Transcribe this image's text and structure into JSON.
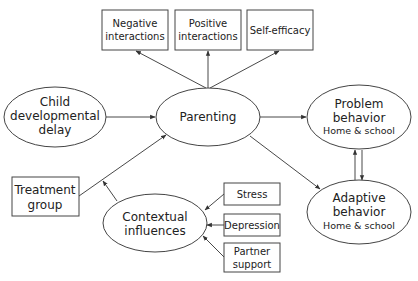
{
  "diagram": {
    "nodes": [
      {
        "id": "neg",
        "shape": "box",
        "lines": [
          "Negative",
          "interactions"
        ]
      },
      {
        "id": "pos",
        "shape": "box",
        "lines": [
          "Positive",
          "interactions"
        ]
      },
      {
        "id": "self",
        "shape": "box",
        "lines": [
          "Self-efficacy"
        ]
      },
      {
        "id": "child",
        "shape": "ellipse",
        "lines": [
          "Child",
          "developmental",
          "delay"
        ]
      },
      {
        "id": "parenting",
        "shape": "ellipse",
        "lines": [
          "Parenting"
        ]
      },
      {
        "id": "problem",
        "shape": "ellipse",
        "lines": [
          "Problem",
          "behavior"
        ],
        "sub": "Home & school"
      },
      {
        "id": "adaptive",
        "shape": "ellipse",
        "lines": [
          "Adaptive",
          "behavior"
        ],
        "sub": "Home & school"
      },
      {
        "id": "treatment",
        "shape": "box",
        "lines": [
          "Treatment",
          "group"
        ]
      },
      {
        "id": "contextual",
        "shape": "ellipse",
        "lines": [
          "Contextual",
          "influences"
        ]
      },
      {
        "id": "stress",
        "shape": "box",
        "lines": [
          "Stress"
        ]
      },
      {
        "id": "depression",
        "shape": "box",
        "lines": [
          "Depression"
        ]
      },
      {
        "id": "partner",
        "shape": "box",
        "lines": [
          "Partner",
          "support"
        ]
      }
    ],
    "edges": [
      {
        "from": "parenting",
        "to": "neg"
      },
      {
        "from": "parenting",
        "to": "pos"
      },
      {
        "from": "parenting",
        "to": "self"
      },
      {
        "from": "child",
        "to": "parenting"
      },
      {
        "from": "parenting",
        "to": "problem"
      },
      {
        "from": "parenting",
        "to": "adaptive"
      },
      {
        "from": "problem",
        "to": "adaptive",
        "bidirectional": true
      },
      {
        "from": "treatment",
        "to": "parenting"
      },
      {
        "from": "contextual",
        "to": "treatment-parenting-path"
      },
      {
        "from": "stress",
        "to": "contextual"
      },
      {
        "from": "depression",
        "to": "contextual"
      },
      {
        "from": "partner",
        "to": "contextual"
      }
    ]
  }
}
